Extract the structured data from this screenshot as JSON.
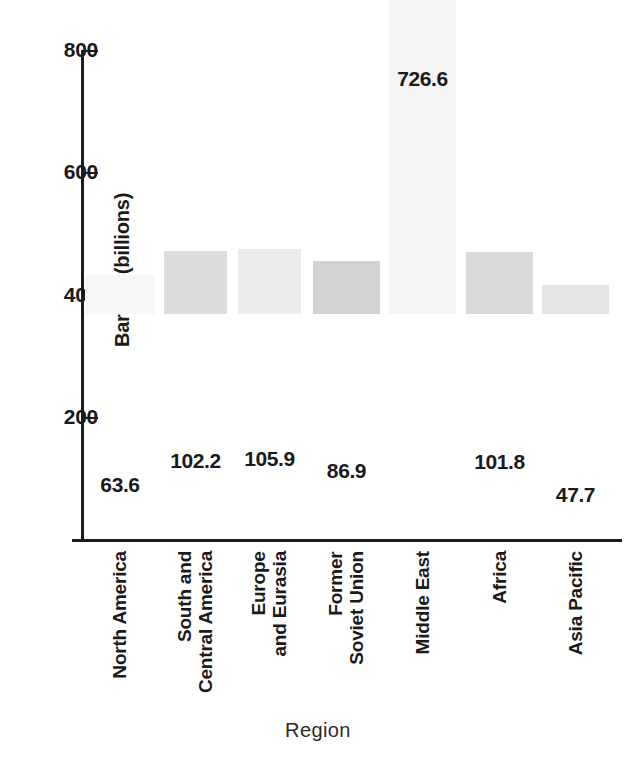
{
  "chart_data": {
    "type": "bar",
    "title": "",
    "subtitle": "",
    "xlabel": "Region",
    "ylabel": "Barrels (billions)",
    "categories": [
      "North America",
      "South and Central America",
      "Europe and Eurasia",
      "Former Soviet Union",
      "Middle East",
      "Africa",
      "Asia Pacific"
    ],
    "category_lines": [
      [
        "North America"
      ],
      [
        "South and",
        "Central America"
      ],
      [
        "Europe",
        "and Eurasia"
      ],
      [
        "Former",
        "Soviet Union"
      ],
      [
        "Middle East"
      ],
      [
        "Africa"
      ],
      [
        "Asia Pacific"
      ]
    ],
    "values": [
      63.6,
      102.2,
      105.9,
      86.9,
      726.6,
      101.8,
      47.7
    ],
    "value_labels": [
      "63.6",
      "102.2",
      "105.9",
      "86.9",
      "726.6",
      "101.8",
      "47.7"
    ],
    "bar_colors": [
      "#f7f7f7",
      "#dcdcdc",
      "#ececec",
      "#d2d2d2",
      "#f4f4f4",
      "#dadada",
      "#e4e4e4"
    ],
    "ylim": [
      0,
      800
    ],
    "ytick_values": [
      200,
      400,
      600,
      800
    ],
    "ytick_labels": [
      "200",
      "400",
      "600",
      "800"
    ],
    "grid": false,
    "legend": false,
    "legend_position": "none",
    "axis_color": "#1c1c1c"
  }
}
